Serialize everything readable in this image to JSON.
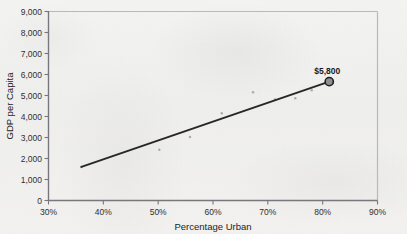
{
  "chart_data": {
    "type": "scatter",
    "title": "",
    "xlabel": "Percentage Urban",
    "ylabel": "GDP per Capita",
    "xlim": [
      30,
      90
    ],
    "ylim": [
      0,
      9000
    ],
    "xticks": [
      "30%",
      "40%",
      "50%",
      "60%",
      "70%",
      "80%",
      "90%"
    ],
    "xtick_values": [
      30,
      40,
      50,
      60,
      70,
      80,
      90
    ],
    "yticks": [
      "0",
      "1,000",
      "2,000",
      "3,000",
      "4,000",
      "5,000",
      "6,000",
      "7,000",
      "8,000",
      "9,000"
    ],
    "ytick_values": [
      0,
      1000,
      2000,
      3000,
      4000,
      5000,
      6000,
      7000,
      8000,
      9000
    ],
    "grid": false,
    "legend": null,
    "series": [
      {
        "name": "Countries",
        "type": "scatter",
        "marker": "small-dot",
        "color": "#9a9a9e",
        "points": [
          {
            "x": 36.0,
            "y": 1600
          },
          {
            "x": 50.2,
            "y": 2420
          },
          {
            "x": 55.8,
            "y": 3020
          },
          {
            "x": 61.6,
            "y": 4150
          },
          {
            "x": 67.3,
            "y": 5150
          },
          {
            "x": 71.3,
            "y": 4810
          },
          {
            "x": 75.0,
            "y": 4870
          },
          {
            "x": 78.0,
            "y": 5250
          }
        ]
      },
      {
        "name": "Trend line",
        "type": "line",
        "color": "#27272a",
        "points": [
          {
            "x": 36.0,
            "y": 1600
          },
          {
            "x": 81.2,
            "y": 5660
          }
        ]
      }
    ],
    "highlight": {
      "label": "$5,800",
      "x": 81.2,
      "y": 5660,
      "marker_fill": "#8e8e93",
      "marker_stroke": "#1f1f21"
    },
    "annotations": [
      {
        "text": "$5,800",
        "x": 81.2,
        "y": 5660,
        "position": "above",
        "bold": true
      }
    ],
    "style": {
      "background": "#f2f2f0",
      "frame_light": "#b9b9bd",
      "axis_dark": "#6e6e73",
      "line_color": "#27272a",
      "text_color": "#2f2f31"
    }
  }
}
